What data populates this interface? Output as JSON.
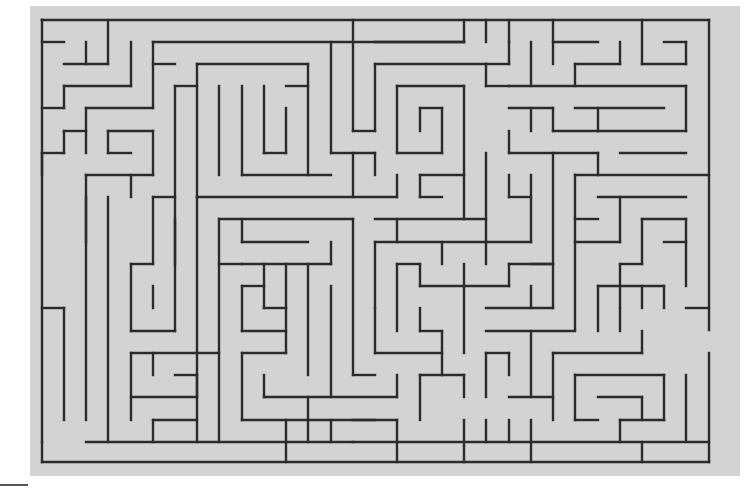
{
  "puzzle": {
    "type": "maze",
    "grid": {
      "cols": 30,
      "rows": 20
    },
    "colors": {
      "background": "#d3d3d3",
      "wall": "#2b2b2b",
      "page": "#ffffff"
    },
    "walls": [
      [
        42,
        20,
        709,
        20
      ],
      [
        42,
        20,
        42,
        175
      ],
      [
        42,
        20,
        42,
        20
      ],
      [
        42,
        42,
        64,
        42
      ],
      [
        86,
        42,
        86,
        64
      ],
      [
        64,
        64,
        108,
        64
      ],
      [
        108,
        20,
        108,
        64
      ],
      [
        131,
        42,
        131,
        86
      ],
      [
        64,
        86,
        131,
        86
      ],
      [
        64,
        86,
        64,
        108
      ],
      [
        42,
        108,
        64,
        108
      ],
      [
        153,
        42,
        153,
        108
      ],
      [
        153,
        42,
        464,
        42
      ],
      [
        153,
        64,
        175,
        64
      ],
      [
        86,
        108,
        153,
        108
      ],
      [
        86,
        108,
        86,
        153
      ],
      [
        64,
        131,
        86,
        131
      ],
      [
        64,
        131,
        64,
        153
      ],
      [
        42,
        153,
        64,
        153
      ],
      [
        42,
        153,
        42,
        442
      ],
      [
        108,
        131,
        153,
        131
      ],
      [
        108,
        131,
        108,
        153
      ],
      [
        108,
        153,
        131,
        153
      ],
      [
        153,
        131,
        153,
        175
      ],
      [
        86,
        175,
        153,
        175
      ],
      [
        86,
        175,
        86,
        242
      ],
      [
        108,
        197,
        108,
        442
      ],
      [
        131,
        197,
        131,
        175
      ],
      [
        175,
        86,
        197,
        86
      ],
      [
        175,
        86,
        175,
        264
      ],
      [
        197,
        64,
        197,
        197
      ],
      [
        197,
        64,
        308,
        64
      ],
      [
        219,
        86,
        219,
        175
      ],
      [
        242,
        86,
        242,
        175
      ],
      [
        264,
        86,
        264,
        153
      ],
      [
        264,
        153,
        286,
        153
      ],
      [
        286,
        108,
        286,
        153
      ],
      [
        286,
        86,
        308,
        86
      ],
      [
        308,
        64,
        308,
        175
      ],
      [
        242,
        175,
        331,
        175
      ],
      [
        331,
        42,
        331,
        153
      ],
      [
        331,
        153,
        375,
        153
      ],
      [
        353,
        20,
        353,
        131
      ],
      [
        353,
        131,
        375,
        131
      ],
      [
        375,
        64,
        375,
        131
      ],
      [
        375,
        64,
        486,
        64
      ],
      [
        375,
        42,
        464,
        42
      ],
      [
        464,
        20,
        464,
        42
      ],
      [
        397,
        86,
        464,
        86
      ],
      [
        397,
        86,
        397,
        153
      ],
      [
        420,
        108,
        442,
        108
      ],
      [
        420,
        108,
        420,
        131
      ],
      [
        442,
        108,
        442,
        153
      ],
      [
        397,
        153,
        442,
        153
      ],
      [
        464,
        86,
        464,
        219
      ],
      [
        353,
        153,
        353,
        197
      ],
      [
        375,
        153,
        375,
        175
      ],
      [
        420,
        175,
        464,
        175
      ],
      [
        420,
        175,
        420,
        197
      ],
      [
        420,
        197,
        442,
        197
      ],
      [
        197,
        197,
        397,
        197
      ],
      [
        397,
        175,
        397,
        197
      ],
      [
        197,
        197,
        197,
        442
      ],
      [
        153,
        197,
        175,
        197
      ],
      [
        153,
        197,
        153,
        264
      ],
      [
        131,
        264,
        153,
        264
      ],
      [
        131,
        264,
        131,
        331
      ],
      [
        131,
        331,
        175,
        331
      ],
      [
        153,
        286,
        153,
        308
      ],
      [
        175,
        219,
        175,
        331
      ],
      [
        219,
        219,
        219,
        442
      ],
      [
        219,
        219,
        353,
        219
      ],
      [
        242,
        219,
        242,
        242
      ],
      [
        242,
        242,
        308,
        242
      ],
      [
        331,
        242,
        331,
        264
      ],
      [
        242,
        264,
        331,
        264
      ],
      [
        353,
        219,
        353,
        375
      ],
      [
        375,
        242,
        375,
        308
      ],
      [
        375,
        242,
        486,
        242
      ],
      [
        397,
        219,
        397,
        242
      ],
      [
        375,
        219,
        486,
        219
      ],
      [
        486,
        153,
        486,
        242
      ],
      [
        486,
        20,
        486,
        42
      ],
      [
        509,
        42,
        509,
        64
      ],
      [
        486,
        64,
        509,
        64
      ],
      [
        486,
        64,
        486,
        86
      ],
      [
        486,
        86,
        509,
        86
      ],
      [
        509,
        20,
        509,
        42
      ],
      [
        531,
        42,
        531,
        86
      ],
      [
        553,
        20,
        553,
        64
      ],
      [
        553,
        42,
        598,
        42
      ],
      [
        575,
        64,
        620,
        64
      ],
      [
        620,
        42,
        620,
        64
      ],
      [
        575,
        64,
        575,
        86
      ],
      [
        642,
        20,
        642,
        64
      ],
      [
        642,
        64,
        686,
        64
      ],
      [
        686,
        42,
        686,
        64
      ],
      [
        664,
        42,
        686,
        42
      ],
      [
        509,
        86,
        686,
        86
      ],
      [
        509,
        108,
        553,
        108
      ],
      [
        553,
        108,
        553,
        131
      ],
      [
        553,
        131,
        598,
        131
      ],
      [
        575,
        108,
        664,
        108
      ],
      [
        598,
        108,
        598,
        131
      ],
      [
        531,
        108,
        531,
        131
      ],
      [
        509,
        131,
        509,
        153
      ],
      [
        509,
        153,
        598,
        153
      ],
      [
        598,
        131,
        686,
        131
      ],
      [
        686,
        86,
        686,
        131
      ],
      [
        620,
        153,
        686,
        153
      ],
      [
        598,
        153,
        598,
        175
      ],
      [
        709,
        20,
        709,
        330
      ],
      [
        709,
        353,
        709,
        462
      ],
      [
        575,
        175,
        709,
        175
      ],
      [
        575,
        175,
        575,
        330
      ],
      [
        598,
        197,
        686,
        197
      ],
      [
        620,
        197,
        620,
        242
      ],
      [
        575,
        219,
        598,
        219
      ],
      [
        575,
        242,
        620,
        242
      ],
      [
        642,
        219,
        642,
        264
      ],
      [
        642,
        219,
        686,
        219
      ],
      [
        686,
        219,
        686,
        286
      ],
      [
        664,
        242,
        686,
        242
      ],
      [
        620,
        264,
        642,
        264
      ],
      [
        620,
        264,
        620,
        308
      ],
      [
        598,
        286,
        664,
        286
      ],
      [
        598,
        286,
        598,
        331
      ],
      [
        642,
        286,
        642,
        308
      ],
      [
        620,
        308,
        620,
        331
      ],
      [
        664,
        286,
        664,
        308
      ],
      [
        686,
        308,
        709,
        308
      ],
      [
        486,
        242,
        486,
        264
      ],
      [
        509,
        197,
        531,
        197
      ],
      [
        509,
        175,
        509,
        197
      ],
      [
        531,
        175,
        531,
        242
      ],
      [
        486,
        242,
        531,
        242
      ],
      [
        553,
        153,
        553,
        308
      ],
      [
        509,
        264,
        553,
        264
      ],
      [
        509,
        264,
        509,
        286
      ],
      [
        420,
        286,
        509,
        286
      ],
      [
        420,
        264,
        420,
        286
      ],
      [
        442,
        242,
        442,
        264
      ],
      [
        464,
        264,
        464,
        286
      ],
      [
        397,
        264,
        420,
        264
      ],
      [
        397,
        264,
        397,
        331
      ],
      [
        486,
        308,
        553,
        308
      ],
      [
        486,
        331,
        575,
        331
      ],
      [
        464,
        286,
        464,
        353
      ],
      [
        420,
        308,
        420,
        331
      ],
      [
        420,
        331,
        442,
        331
      ],
      [
        442,
        331,
        442,
        375
      ],
      [
        375,
        353,
        442,
        353
      ],
      [
        375,
        308,
        375,
        353
      ],
      [
        531,
        286,
        531,
        308
      ],
      [
        531,
        264,
        553,
        264
      ],
      [
        242,
        286,
        264,
        286
      ],
      [
        242,
        286,
        242,
        331
      ],
      [
        242,
        331,
        286,
        331
      ],
      [
        264,
        308,
        286,
        308
      ],
      [
        286,
        264,
        286,
        353
      ],
      [
        264,
        264,
        264,
        308
      ],
      [
        219,
        264,
        242,
        264
      ],
      [
        242,
        353,
        286,
        353
      ],
      [
        308,
        264,
        308,
        375
      ],
      [
        331,
        286,
        331,
        397
      ],
      [
        353,
        375,
        375,
        375
      ],
      [
        242,
        353,
        242,
        420
      ],
      [
        242,
        420,
        375,
        420
      ],
      [
        264,
        375,
        264,
        397
      ],
      [
        264,
        397,
        397,
        397
      ],
      [
        397,
        375,
        397,
        397
      ],
      [
        131,
        353,
        219,
        353
      ],
      [
        131,
        353,
        131,
        420
      ],
      [
        153,
        353,
        153,
        375
      ],
      [
        175,
        375,
        197,
        375
      ],
      [
        197,
        375,
        197,
        397
      ],
      [
        131,
        397,
        197,
        397
      ],
      [
        153,
        420,
        197,
        420
      ],
      [
        153,
        420,
        153,
        442
      ],
      [
        86,
        197,
        86,
        420
      ],
      [
        42,
        308,
        64,
        308
      ],
      [
        64,
        308,
        64,
        420
      ],
      [
        86,
        442,
        709,
        442
      ],
      [
        42,
        462,
        709,
        462
      ],
      [
        42,
        442,
        42,
        462
      ],
      [
        420,
        375,
        420,
        420
      ],
      [
        420,
        375,
        464,
        375
      ],
      [
        464,
        375,
        464,
        397
      ],
      [
        486,
        353,
        486,
        397
      ],
      [
        486,
        353,
        509,
        353
      ],
      [
        509,
        353,
        509,
        375
      ],
      [
        531,
        331,
        531,
        397
      ],
      [
        509,
        397,
        553,
        397
      ],
      [
        553,
        353,
        553,
        420
      ],
      [
        553,
        353,
        642,
        353
      ],
      [
        642,
        331,
        642,
        353
      ],
      [
        575,
        375,
        664,
        375
      ],
      [
        664,
        375,
        664,
        420
      ],
      [
        575,
        375,
        575,
        420
      ],
      [
        575,
        420,
        598,
        420
      ],
      [
        598,
        397,
        642,
        397
      ],
      [
        642,
        397,
        642,
        420
      ],
      [
        620,
        420,
        664,
        420
      ],
      [
        620,
        420,
        620,
        442
      ],
      [
        686,
        375,
        686,
        440
      ],
      [
        308,
        420,
        308,
        442
      ],
      [
        331,
        420,
        331,
        442
      ],
      [
        353,
        442,
        353,
        442
      ],
      [
        353,
        420,
        397,
        420
      ],
      [
        397,
        420,
        397,
        462
      ],
      [
        464,
        420,
        464,
        462
      ],
      [
        486,
        420,
        486,
        442
      ],
      [
        509,
        420,
        509,
        442
      ],
      [
        531,
        420,
        531,
        462
      ],
      [
        642,
        442,
        642,
        462
      ],
      [
        286,
        420,
        286,
        462
      ],
      [
        308,
        397,
        308,
        420
      ]
    ]
  }
}
